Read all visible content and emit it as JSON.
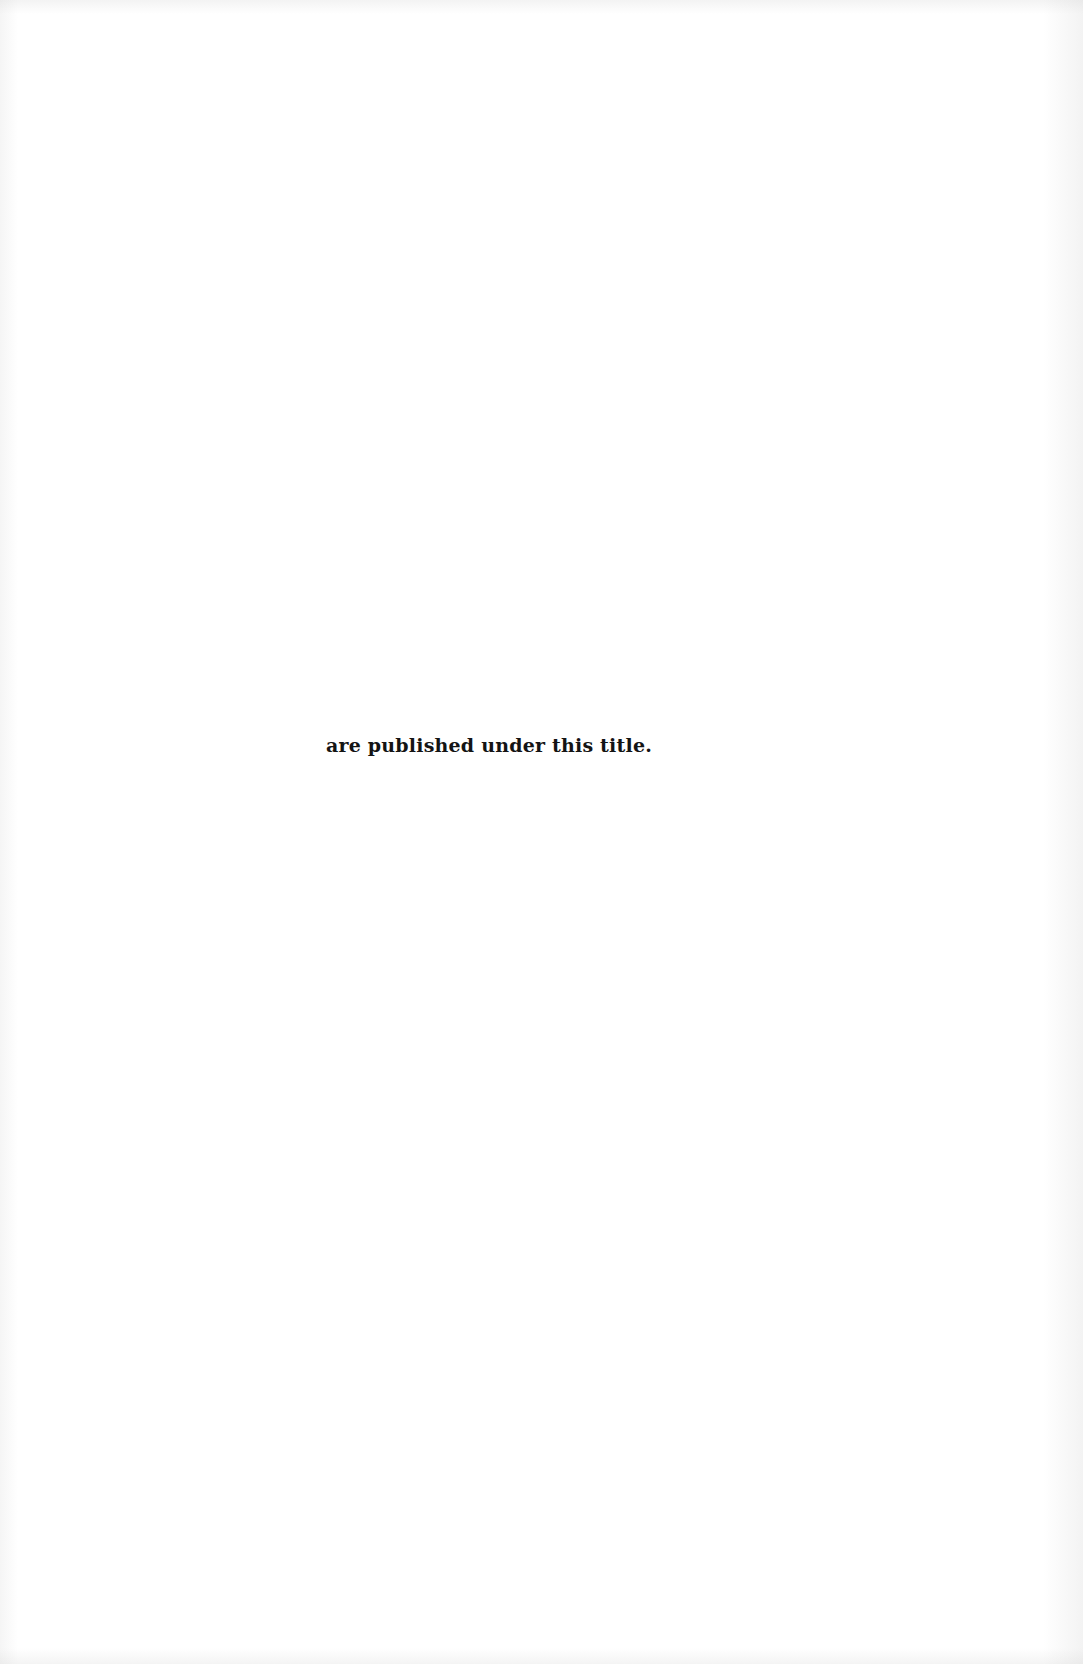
{
  "page": {
    "background_color": "#ffffff",
    "text_color": "#141414",
    "lines": [
      "are published under this title."
    ]
  }
}
